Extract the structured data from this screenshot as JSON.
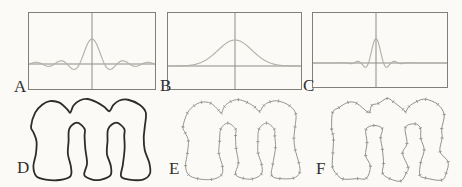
{
  "colors": {
    "background": "#fbfaf7",
    "frame": "#807f7a",
    "axis": "#8d8c87",
    "curve": "#b2afa7",
    "label": "#2f2f2f"
  },
  "plots": [
    {
      "label": "A",
      "box": [
        28,
        12,
        128,
        78
      ],
      "vline_x": 92,
      "axis_y": 64,
      "label_pos": [
        14,
        78
      ]
    },
    {
      "label": "B",
      "box": [
        167,
        12,
        135,
        78
      ],
      "vline_x": 235,
      "axis_y": 66,
      "label_pos": [
        160,
        77
      ]
    },
    {
      "label": "C",
      "box": [
        312,
        12,
        136,
        76
      ],
      "vline_x": 376,
      "axis_y": 63,
      "label_pos": [
        303,
        77
      ]
    }
  ],
  "chart_data": [
    {
      "panel": "A",
      "type": "line",
      "curve": "windowed-sinc",
      "description": "oscillating sinc-like kernel: tall central peak with decaying side ripples spanning full box, drawn over a horizontal baseline and vertical center axis; no tick labels",
      "amplitude_px": 25,
      "first_zero_px": 12.5,
      "window_sigma_px": 500,
      "title": "",
      "xlabel": "",
      "ylabel": "",
      "gridlines": "center crosshair only"
    },
    {
      "panel": "B",
      "type": "line",
      "curve": "gaussian",
      "description": "single broad smooth bell curve centered on the vertical axis, tails merging into the baseline; no tick labels",
      "amplitude_px": 26,
      "sigma_px": 17,
      "title": "",
      "xlabel": "",
      "ylabel": "",
      "gridlines": "center crosshair only"
    },
    {
      "panel": "C",
      "type": "line",
      "curve": "windowed-sinc",
      "description": "narrow central peak with one pair of small negative side lobes, flat elsewhere; no tick labels",
      "amplitude_px": 24.5,
      "first_zero_px": 7.5,
      "window_sigma_px": 23,
      "title": "",
      "xlabel": "",
      "ylabel": "",
      "gridlines": "center crosshair only"
    }
  ],
  "shapes": [
    {
      "label": "D",
      "box": [
        31,
        99,
        119,
        81
      ],
      "stroke": "#2c2c2c",
      "stroke_width": 1.8,
      "markers": false,
      "roughness": 0,
      "seed": 1,
      "label_pos": [
        17,
        159
      ],
      "description": "smooth dark outline of lowercase letter m"
    },
    {
      "label": "E",
      "box": [
        183,
        100,
        117,
        79
      ],
      "stroke": "#8a8a84",
      "stroke_width": 0.9,
      "markers": true,
      "roughness": 0.5,
      "seed": 3,
      "label_pos": [
        169,
        160
      ],
      "description": "thin gray m contour with small sample-point tick markers"
    },
    {
      "label": "F",
      "box": [
        330,
        100,
        117,
        80
      ],
      "stroke": "#85857f",
      "stroke_width": 0.9,
      "markers": true,
      "roughness": 2.2,
      "seed": 7,
      "label_pos": [
        316,
        160
      ],
      "description": "rough wobbly m contour reconstructed from sample points with tick markers"
    }
  ],
  "contour_points": [
    [
      0,
      30
    ],
    [
      4,
      17
    ],
    [
      10.7,
      9.7
    ],
    [
      18,
      6.3
    ],
    [
      27.3,
      7.7
    ],
    [
      35,
      14.3
    ],
    [
      37.7,
      17
    ],
    [
      40.7,
      10.3
    ],
    [
      46.7,
      5.7
    ],
    [
      54,
      4.3
    ],
    [
      62.3,
      7
    ],
    [
      70,
      11.5
    ],
    [
      75,
      15.7
    ],
    [
      79,
      9.7
    ],
    [
      84.7,
      5.7
    ],
    [
      93,
      5
    ],
    [
      104,
      9.7
    ],
    [
      110,
      17
    ],
    [
      109,
      30.3
    ],
    [
      108,
      40.3
    ],
    [
      109,
      52
    ],
    [
      113.3,
      63.7
    ],
    [
      114,
      73.7
    ],
    [
      107.3,
      79.3
    ],
    [
      94,
      79.3
    ],
    [
      86.3,
      76.3
    ],
    [
      88,
      65.3
    ],
    [
      89.7,
      50.3
    ],
    [
      89.3,
      38.7
    ],
    [
      89.3,
      32
    ],
    [
      81.7,
      26.3
    ],
    [
      74,
      32
    ],
    [
      73.3,
      43.7
    ],
    [
      72.7,
      55.3
    ],
    [
      76.3,
      66
    ],
    [
      76.3,
      75
    ],
    [
      67.3,
      79.3
    ],
    [
      58.7,
      79.3
    ],
    [
      51,
      75
    ],
    [
      53.7,
      64.3
    ],
    [
      52,
      50.3
    ],
    [
      51.3,
      38.7
    ],
    [
      51.3,
      32
    ],
    [
      44,
      26.3
    ],
    [
      36.7,
      32
    ],
    [
      36,
      43.7
    ],
    [
      35.3,
      55.3
    ],
    [
      38.3,
      67.7
    ],
    [
      37.7,
      76.3
    ],
    [
      27.3,
      79.7
    ],
    [
      14,
      79.3
    ],
    [
      5,
      76
    ],
    [
      2.3,
      67
    ],
    [
      4.7,
      55.3
    ],
    [
      5.3,
      43.7
    ],
    [
      2.3,
      35.3
    ]
  ]
}
